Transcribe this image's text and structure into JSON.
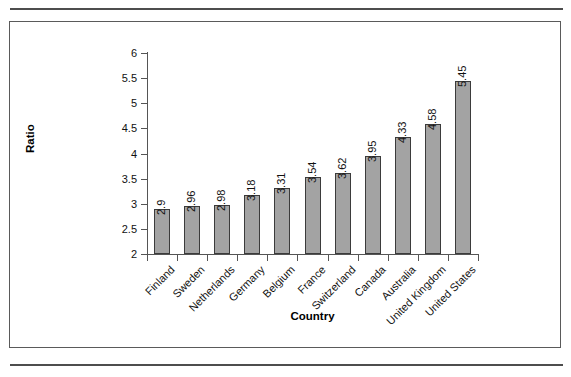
{
  "figure": {
    "frame_border_color": "#5a5a5a",
    "rule_color": "#4d4d4d",
    "background": "#ffffff"
  },
  "chart_data": {
    "type": "bar",
    "title": "",
    "xlabel": "Country",
    "ylabel": "Ratio",
    "ylim": [
      2,
      6
    ],
    "y_ticks": [
      "2",
      "2.5",
      "3",
      "3.5",
      "4",
      "4.5",
      "5",
      "5.5",
      "6"
    ],
    "y_tick_values": [
      2,
      2.5,
      3,
      3.5,
      4,
      4.5,
      5,
      5.5,
      6
    ],
    "grid": false,
    "legend": "none",
    "bar_color": "#a3a3a3",
    "bar_border_color": "#3b3b3b",
    "value_label_rotation": "-90",
    "category_label_rotation": "-45",
    "categories": [
      "Finland",
      "Sweden",
      "Netherlands",
      "Germany",
      "Belgium",
      "France",
      "Switzerland",
      "Canada",
      "Australia",
      "United Kingdom",
      "United States"
    ],
    "values": [
      2.9,
      2.96,
      2.98,
      3.18,
      3.31,
      3.54,
      3.62,
      3.95,
      4.33,
      4.58,
      5.45
    ],
    "value_labels": [
      "2.9",
      "2.96",
      "2.98",
      "3.18",
      "3.31",
      "3.54",
      "3.62",
      "3.95",
      "4.33",
      "4.58",
      "5.45"
    ]
  }
}
